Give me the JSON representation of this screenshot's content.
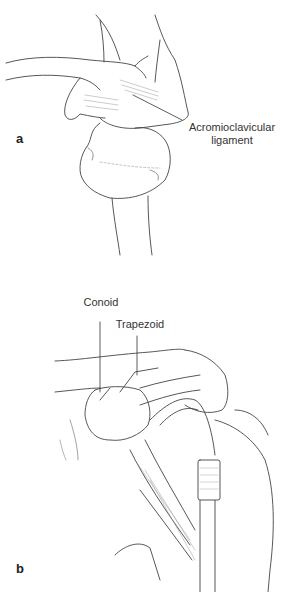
{
  "figure": {
    "panels": [
      {
        "id": "a",
        "letter": "a",
        "labels": [
          {
            "line1": "Acromioclavicular",
            "line2": "ligament"
          }
        ]
      },
      {
        "id": "b",
        "letter": "b",
        "labels": [
          {
            "text": "Conoid"
          },
          {
            "text": "Trapezoid"
          }
        ]
      }
    ]
  }
}
